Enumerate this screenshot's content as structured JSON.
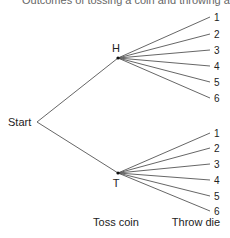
{
  "caption": "Outcomes of tossing a coin and throwing a die",
  "tree": {
    "root": {
      "label": "Start",
      "x": 37,
      "y": 122,
      "label_x": 8,
      "label_y": 126
    },
    "stage_labels": [
      {
        "label": "Toss coin",
        "x": 116,
        "y": 226
      },
      {
        "label": "Throw die",
        "x": 196,
        "y": 226
      }
    ],
    "branches": [
      {
        "label": "H",
        "x": 118,
        "y": 58,
        "label_x": 116,
        "label_y": 52,
        "leaves": [
          {
            "label": "1",
            "x": 210,
            "y": 17
          },
          {
            "label": "2",
            "x": 210,
            "y": 34
          },
          {
            "label": "3",
            "x": 210,
            "y": 50
          },
          {
            "label": "4",
            "x": 210,
            "y": 66
          },
          {
            "label": "5",
            "x": 210,
            "y": 82
          },
          {
            "label": "6",
            "x": 210,
            "y": 98
          }
        ]
      },
      {
        "label": "T",
        "x": 118,
        "y": 173,
        "label_x": 116,
        "label_y": 187,
        "leaves": [
          {
            "label": "1",
            "x": 210,
            "y": 133
          },
          {
            "label": "2",
            "x": 210,
            "y": 148
          },
          {
            "label": "3",
            "x": 210,
            "y": 164
          },
          {
            "label": "4",
            "x": 210,
            "y": 180
          },
          {
            "label": "5",
            "x": 210,
            "y": 196
          },
          {
            "label": "6",
            "x": 210,
            "y": 211
          }
        ]
      }
    ]
  }
}
